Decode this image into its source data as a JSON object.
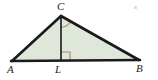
{
  "figure": {
    "background_color": "#ffffff",
    "fill_color": "#dfe7da",
    "stroke_color": "#1a1a1a",
    "marker_color": "#a98a6a",
    "labels": {
      "A": "A",
      "B": "B",
      "C": "C",
      "L": "L"
    },
    "points": {
      "A": {
        "x": 12,
        "y": 61
      },
      "B": {
        "x": 139,
        "y": 60
      },
      "C": {
        "x": 61,
        "y": 16
      },
      "L": {
        "x": 61,
        "y": 61
      }
    },
    "segments": [
      {
        "name": "side-AC",
        "from": "A",
        "to": "C"
      },
      {
        "name": "side-CB",
        "from": "C",
        "to": "B"
      },
      {
        "name": "base-AB",
        "from": "A",
        "to": "B"
      },
      {
        "name": "altitude-CL",
        "from": "C",
        "to": "L"
      }
    ],
    "markers": {
      "right_angle_at_L": "right-angle-square",
      "angle_at_C": "angle-arc"
    },
    "speck": "scan-artifact-speck"
  }
}
